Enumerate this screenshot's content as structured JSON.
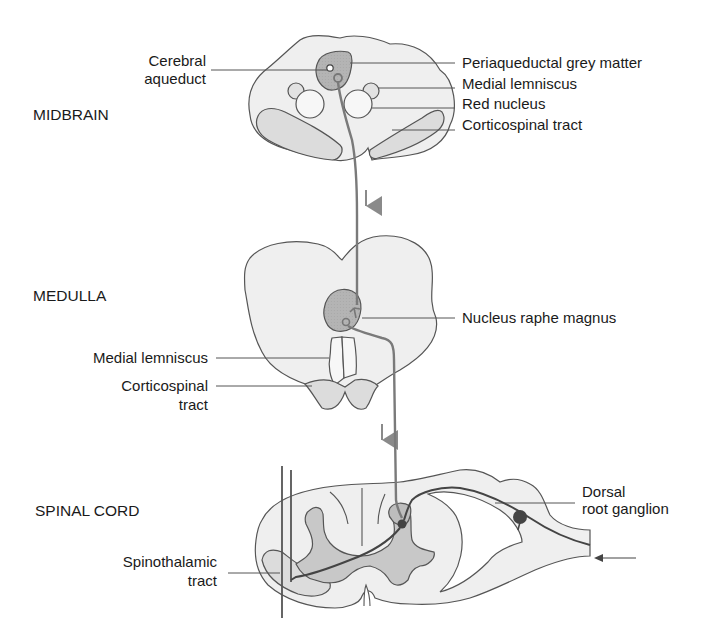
{
  "sections": {
    "midbrain": "MIDBRAIN",
    "medulla": "MEDULLA",
    "spinal_cord": "SPINAL CORD"
  },
  "labels": {
    "midbrain": {
      "cerebral_aqueduct": [
        "Cerebral",
        "aqueduct"
      ],
      "periaqueductal_grey": "Periaqueductal grey matter",
      "medial_lemniscus": "Medial lemniscus",
      "red_nucleus": "Red nucleus",
      "corticospinal_tract": "Corticospinal tract"
    },
    "medulla": {
      "nucleus_raphe_magnus": "Nucleus raphe magnus",
      "medial_lemniscus": "Medial lemniscus",
      "corticospinal_tract": [
        "Corticospinal",
        "tract"
      ]
    },
    "spinal_cord": {
      "dorsal_root_ganglion": [
        "Dorsal",
        "root ganglion"
      ],
      "spinothalamic_tract": [
        "Spinothalamic",
        "tract"
      ]
    }
  },
  "colors": {
    "tissue": "#efefef",
    "tract": "#dcdcdc",
    "grey_matter": "#b9b9b9",
    "outline": "#555555",
    "neuron": "#7a7a7a",
    "arrow": "#8a8a8a"
  }
}
